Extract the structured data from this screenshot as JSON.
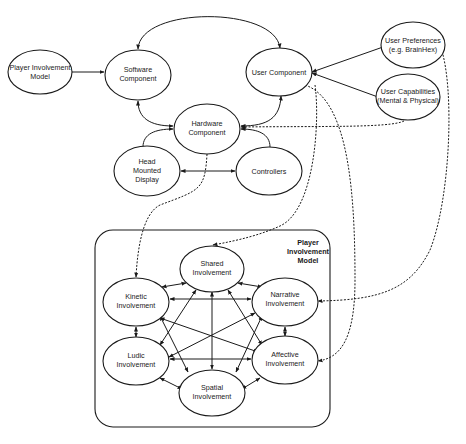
{
  "diagram": {
    "nodes": {
      "player_involvement_model": {
        "line1": "Player Involvement",
        "line2": "Model"
      },
      "software_component": {
        "line1": "Software",
        "line2": "Component"
      },
      "user_component": {
        "line1": "User Component"
      },
      "user_preferences": {
        "line1": "User Preferences",
        "line2": "(e.g. BrainHex)"
      },
      "user_capabilities": {
        "line1": "User Capabilities",
        "line2": "(Mental & Physical)"
      },
      "hardware_component": {
        "line1": "Hardware",
        "line2": "Component"
      },
      "head_mounted_display": {
        "line1": "Head",
        "line2": "Mounted",
        "line3": "Display"
      },
      "controllers": {
        "line1": "Controllers"
      },
      "shared_involvement": {
        "line1": "Shared",
        "line2": "Involvement"
      },
      "kinetic_involvement": {
        "line1": "Kinetic",
        "line2": "Involvement"
      },
      "narrative_involvement": {
        "line1": "Narrative",
        "line2": "Involvement"
      },
      "ludic_involvement": {
        "line1": "Ludic",
        "line2": "Involvement"
      },
      "affective_involvement": {
        "line1": "Affective",
        "line2": "Involvement"
      },
      "spatial_involvement": {
        "line1": "Spatial",
        "line2": "Involvement"
      }
    },
    "container": {
      "line1": "Player",
      "line2": "Involvement",
      "line3": "Model"
    },
    "colors": {
      "stroke": "#1a1a1a",
      "fill": "#ffffff",
      "background": "#ffffff"
    }
  }
}
